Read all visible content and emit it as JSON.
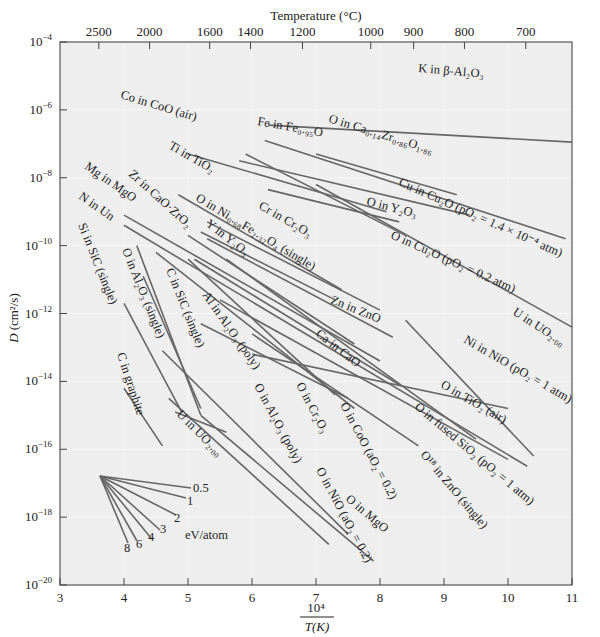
{
  "chart_data": {
    "type": "line",
    "title": "",
    "xlabel": "10^4 / T(K)",
    "ylabel": "D (cm²/s)",
    "top_axis_label": "Temperature (°C)",
    "xlim": [
      3,
      11
    ],
    "ylim_log10": [
      -20,
      -4
    ],
    "yscale": "log",
    "grid": true,
    "x_ticks": [
      3,
      4,
      5,
      6,
      7,
      8,
      9,
      10,
      11
    ],
    "y_ticks": [
      "10^-4",
      "10^-6",
      "10^-8",
      "10^-10",
      "10^-12",
      "10^-14",
      "10^-16",
      "10^-18",
      "10^-20"
    ],
    "y_tick_exponents": [
      -4,
      -6,
      -8,
      -10,
      -12,
      -14,
      -16,
      -18,
      -20
    ],
    "top_ticks_celsius": [
      2500,
      2000,
      1600,
      1400,
      1200,
      1000,
      900,
      800,
      700
    ],
    "series": [
      {
        "name": "K in β-Al2O3",
        "x": [
          6.25,
          11.0
        ],
        "log10_D": [
          -6.45,
          -6.95
        ]
      },
      {
        "name": "O in Ca0.14Zr0.86O1.86",
        "x": [
          6.2,
          10.9
        ],
        "log10_D": [
          -6.9,
          -9.8
        ]
      },
      {
        "name": "Fe in Fe0.95O",
        "x": [
          7.0,
          9.2
        ],
        "log10_D": [
          -7.3,
          -8.5
        ]
      },
      {
        "name": "Co in CoO (air)",
        "x": [
          5.0,
          8.1
        ],
        "log10_D": [
          -7.3,
          -9.0
        ]
      },
      {
        "name": "Cu in Cu2O (pO2 = 1.4 × 10^-4 atm)",
        "x": [
          5.8,
          9.4
        ],
        "log10_D": [
          -7.5,
          -9.1
        ]
      },
      {
        "name": "O in Y2O3",
        "x": [
          6.25,
          8.3
        ],
        "log10_D": [
          -8.35,
          -9.3
        ]
      },
      {
        "name": "O in Cu2O (pO2 = 0.2 atm)",
        "x": [
          5.9,
          8.4
        ],
        "log10_D": [
          -7.3,
          -9.7
        ]
      },
      {
        "name": "U in UO2.00",
        "x": [
          7.0,
          11.0
        ],
        "log10_D": [
          -8.2,
          -12.4
        ]
      },
      {
        "name": "Ti in TiO2",
        "x": [
          4.85,
          7.4
        ],
        "log10_D": [
          -8.5,
          -11.3
        ]
      },
      {
        "name": "Cr in Cr2O3",
        "x": [
          5.3,
          8.0
        ],
        "log10_D": [
          -9.3,
          -11.9
        ]
      },
      {
        "name": "O in Ni0.68Fe2.32O4 (single)",
        "x": [
          5.2,
          7.3
        ],
        "log10_D": [
          -9.6,
          -11.6
        ]
      },
      {
        "name": "Zn in ZnO",
        "x": [
          5.3,
          8.2
        ],
        "log10_D": [
          -9.8,
          -12.7
        ]
      },
      {
        "name": "Ni in NiO (pO2 = 1 atm)",
        "x": [
          8.4,
          10.4
        ],
        "log10_D": [
          -12.2,
          -16.2
        ]
      },
      {
        "name": "Mg in MgO",
        "x": [
          4.0,
          8.0
        ],
        "log10_D": [
          -9.1,
          -13.4
        ]
      },
      {
        "name": "Zr in CaO·ZrO2",
        "x": [
          5.0,
          7.6
        ],
        "log10_D": [
          -9.7,
          -12.9
        ]
      },
      {
        "name": "Y in Y2O3",
        "x": [
          5.1,
          8.3
        ],
        "log10_D": [
          -10.4,
          -14.1
        ]
      },
      {
        "name": "N in Un",
        "x": [
          4.0,
          10.3
        ],
        "log10_D": [
          -9.4,
          -16.5
        ]
      },
      {
        "name": "Ca in CaO",
        "x": [
          5.6,
          9.5
        ],
        "log10_D": [
          -10.4,
          -15.7
        ]
      },
      {
        "name": "O in TiO2 (air)",
        "x": [
          6.0,
          10.0
        ],
        "log10_D": [
          -13.2,
          -14.8
        ]
      },
      {
        "name": "O in fused SiO2 (pO2 = 1 atm)",
        "x": [
          5.5,
          10.0
        ],
        "log10_D": [
          -11.6,
          -16.3
        ]
      },
      {
        "name": "Al in Al2O3 (poly)",
        "x": [
          4.5,
          7.6
        ],
        "log10_D": [
          -10.2,
          -14.8
        ]
      },
      {
        "name": "O in Cr2O3",
        "x": [
          5.2,
          7.5
        ],
        "log10_D": [
          -12.3,
          -14.5
        ]
      },
      {
        "name": "O in CoO (aO2 = 0.2)",
        "x": [
          5.0,
          7.3
        ],
        "log10_D": [
          -10.4,
          -14.4
        ]
      },
      {
        "name": "O18 in ZnO (single)",
        "x": [
          6.0,
          8.6
        ],
        "log10_D": [
          -12.6,
          -15.9
        ]
      },
      {
        "name": "Si in SiC (single)",
        "x": [
          4.0,
          4.9
        ],
        "log10_D": [
          -11.7,
          -14.9
        ]
      },
      {
        "name": "O in Al2O3 (single)",
        "x": [
          4.2,
          5.2
        ],
        "log10_D": [
          -10.0,
          -15.0
        ]
      },
      {
        "name": "C in SiC (single)",
        "x": [
          4.3,
          5.2
        ],
        "log10_D": [
          -10.9,
          -14.8
        ]
      },
      {
        "name": "C in graphite",
        "x": [
          4.0,
          4.6
        ],
        "log10_D": [
          -14.2,
          -15.9
        ]
      },
      {
        "name": "U in UO2.00",
        "x": [
          4.8,
          5.6
        ],
        "log10_D": [
          -14.9,
          -15.5
        ]
      },
      {
        "name": "O in Al2O3 (poly)",
        "x": [
          4.6,
          7.5
        ],
        "log10_D": [
          -13.1,
          -18.5
        ]
      },
      {
        "name": "O in NiO (aO2 = 0.2)",
        "x": [
          4.7,
          7.2
        ],
        "log10_D": [
          -14.5,
          -18.8
        ]
      },
      {
        "name": "O in MgO",
        "x": [
          5.2,
          7.9
        ],
        "log10_D": [
          -15.0,
          -19.3
        ]
      }
    ],
    "activation_energy_fan": {
      "unit": "eV/atom",
      "labels": [
        "0.5",
        "1",
        "2",
        "3",
        "4",
        "6",
        "8"
      ]
    },
    "annotations": [
      "eV/atom"
    ]
  },
  "axes": {
    "top_title": "Temperature (°C)",
    "y_title_main": "D",
    "y_title_unit": "(cm²/s)",
    "x_title_numerator": "10⁴",
    "x_title_denominator": "T(K)"
  },
  "labels": {
    "k_in_beta": "K in β-Al₂O₃",
    "o_in_cazr": "O in Ca₀.₁₄Zr₀.₈₆O₁.₈₆",
    "fe_in_feo": "Fe in Fe₀.₉₅O",
    "co_in_coo": "Co in CoO (air)",
    "cu_in_cu2o": "Cu in Cu₂O (pO₂ = 1.4 × 10⁻⁴ atm)",
    "o_in_y2o3": "O in Y₂O₃",
    "o_in_cu2o": "O in Cu₂O (pO₂ = 0.2 atm)",
    "u_in_uo2_right": "U in UO₂.₀₀",
    "ti_in_tio2": "Ti in TiO₂",
    "cr_in_cr2o3": "Cr in Cr₂O₃",
    "o_in_nife": "O in Ni₀.₆₈Fe₂.₃₂O₄ (single)",
    "zn_in_zno": "Zn in ZnO",
    "ni_in_nio": "Ni in NiO (pO₂ = 1 atm)",
    "mg_in_mgo": "Mg in MgO",
    "zr_in_cazr": "Zr in CaO·ZrO₂",
    "y_in_y2o3": "Y in Y₂O₃",
    "n_in_un": "N in Un",
    "ca_in_cao": "Ca in CaO",
    "o_in_tio2": "O in TiO₂ (air)",
    "o_in_sio2": "O in fused SiO₂ (pO₂ = 1 atm)",
    "al_in_al2o3": "Al in Al₂O₃ (poly)",
    "o_in_cr2o3": "O in Cr₂O₃",
    "o_in_coo": "O in CoO (aO₂ = 0.2)",
    "o18_in_zno": "O¹⁸ in ZnO (single)",
    "si_in_sic": "Si in SiC (single)",
    "o_in_al2o3_single": "O in Al₂O₃ (single)",
    "c_in_sic": "C in SiC (single)",
    "c_in_graphite": "C in graphite",
    "u_in_uo2_left": "U in UO₂.₀₀",
    "o_in_al2o3_poly": "O in Al₂O₃ (poly)",
    "o_in_nio": "O in NiO (aO₂ = 0.2)",
    "o_in_mgo": "O in MgO",
    "fan_unit": "eV/atom"
  }
}
